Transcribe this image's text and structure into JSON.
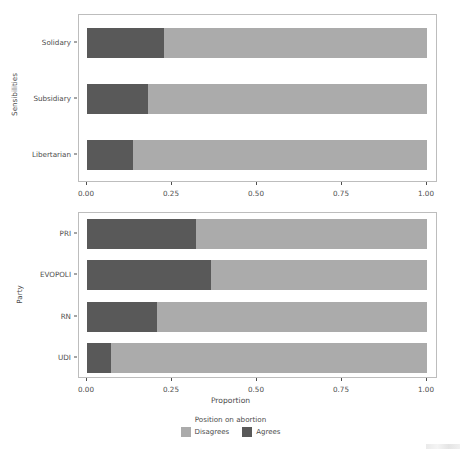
{
  "chart_data": {
    "type": "bar",
    "orientation": "horizontal",
    "stacked": true,
    "normalized": true,
    "title": "",
    "xlabel": "Proportion",
    "xlim": [
      0,
      1
    ],
    "xticks": [
      "0.00",
      "0.25",
      "0.50",
      "0.75",
      "1.00"
    ],
    "xtick_values": [
      0,
      0.25,
      0.5,
      0.75,
      1
    ],
    "grid": false,
    "legend": {
      "title": "Position on abortion",
      "position": "bottom",
      "entries": [
        {
          "label": "Disagrees",
          "color": "#ababab"
        },
        {
          "label": "Agrees",
          "color": "#595959"
        }
      ]
    },
    "panels": [
      {
        "id": "sensibilities",
        "ylabel": "Sensibilities",
        "categories": [
          "Solidary",
          "Subsidiary",
          "Libertarian"
        ],
        "series": [
          {
            "name": "Agrees",
            "color": "#595959",
            "values": [
              0.225,
              0.18,
              0.135
            ]
          },
          {
            "name": "Disagrees",
            "color": "#ababab",
            "values": [
              0.775,
              0.82,
              0.865
            ]
          }
        ]
      },
      {
        "id": "party",
        "ylabel": "Party",
        "categories": [
          "PRI",
          "EVOPOLI",
          "RN",
          "UDI"
        ],
        "series": [
          {
            "name": "Agrees",
            "color": "#595959",
            "values": [
              0.32,
              0.365,
              0.205,
              0.07
            ]
          },
          {
            "name": "Disagrees",
            "color": "#ababab",
            "values": [
              0.68,
              0.635,
              0.795,
              0.93
            ]
          }
        ]
      }
    ]
  },
  "panel_top": {
    "ylabel": "Sensibilities",
    "ytick_labels": [
      "Solidary",
      "Subsidiary",
      "Libertarian"
    ],
    "xtick_labels": [
      "0.00",
      "0.25",
      "0.50",
      "0.75",
      "1.00"
    ]
  },
  "panel_bottom": {
    "ylabel": "Party",
    "ytick_labels": [
      "PRI",
      "EVOPOLI",
      "RN",
      "UDI"
    ],
    "xtick_labels": [
      "0.00",
      "0.25",
      "0.50",
      "0.75",
      "1.00"
    ],
    "xaxis_title": "Proportion"
  },
  "legend": {
    "title": "Position on abortion",
    "items": [
      {
        "label": "Disagrees",
        "color": "#ababab",
        "icon": "legend-swatch-disagrees"
      },
      {
        "label": "Agrees",
        "color": "#595959",
        "icon": "legend-swatch-agrees"
      }
    ]
  },
  "colors": {
    "agrees": "#595959",
    "disagrees": "#ababab",
    "panel_border": "#bdbdbd",
    "text": "#4d4d4d",
    "background": "#ffffff"
  }
}
